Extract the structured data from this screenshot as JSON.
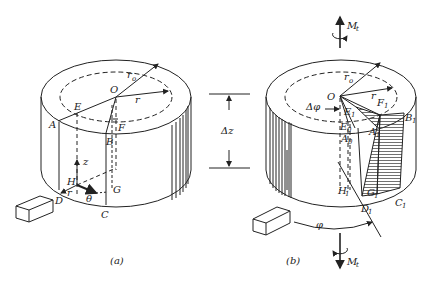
{
  "figure": {
    "panels": [
      {
        "id": "a",
        "caption": "(a)",
        "labels": {
          "O": "O",
          "r0": "r",
          "r0_sub": "o",
          "r": "r",
          "A": "A",
          "B": "B",
          "C": "C",
          "D": "D",
          "E": "E",
          "F": "F",
          "G": "G",
          "H": "H",
          "z": "z",
          "r_axis": "r",
          "theta": "θ"
        }
      },
      {
        "id": "b",
        "caption": "(b)",
        "labels": {
          "O": "O",
          "r0": "r",
          "r0_sub": "o",
          "r": "r",
          "dphi": "Δφ",
          "E1": "E",
          "F1": "F",
          "B1": "B",
          "A1": "A",
          "E0": "E",
          "A0": "A",
          "H1": "H",
          "G1": "G",
          "C1": "C",
          "D1": "D",
          "sub1": "1",
          "sub0": "0",
          "phi": "φ",
          "Mt_top": "M",
          "Mt_bottom": "M",
          "Mt_sub": "t"
        }
      }
    ],
    "dimension": {
      "label": "Δz"
    }
  }
}
